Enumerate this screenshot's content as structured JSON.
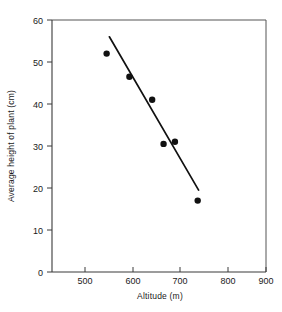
{
  "chart_data": {
    "type": "scatter",
    "title": "",
    "xlabel": "Altitude (m)",
    "ylabel": "Average height of plant (cm)",
    "xlim": [
      430,
      900
    ],
    "ylim": [
      0,
      60
    ],
    "xticks": [
      500,
      600,
      700,
      800,
      900
    ],
    "yticks": [
      0,
      10,
      20,
      30,
      40,
      50,
      60
    ],
    "xtick_labels": [
      "500",
      "600",
      "700",
      "800",
      "900"
    ],
    "ytick_labels": [
      "0",
      "10",
      "20",
      "30",
      "40",
      "50",
      "60"
    ],
    "grid": false,
    "legend": null,
    "series": [
      {
        "name": "Average height of plant",
        "marker": "filled-circle",
        "color": "#111111",
        "points": [
          {
            "x": 550,
            "y": 52.0
          },
          {
            "x": 600,
            "y": 46.5
          },
          {
            "x": 650,
            "y": 41.0
          },
          {
            "x": 675,
            "y": 30.5
          },
          {
            "x": 700,
            "y": 31.0
          },
          {
            "x": 750,
            "y": 17.0
          }
        ]
      }
    ],
    "trend_line": {
      "name": "best-fit line",
      "color": "#111111",
      "x_start": 556,
      "y_start": 56.0,
      "x_end": 752,
      "y_end": 19.5
    },
    "annotations": []
  },
  "figure": {
    "background_color": "#ffffff",
    "axis_color": "#3a3a3a",
    "frame_color": "#555555",
    "marker_color": "#111111"
  }
}
